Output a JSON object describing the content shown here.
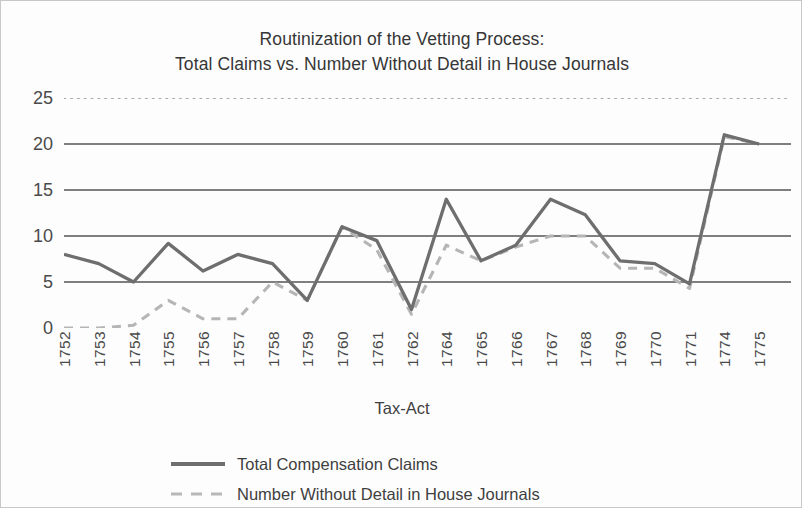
{
  "title": {
    "line1": "Routinization of the Vetting Process:",
    "line2": "Total Claims vs. Number Without Detail in House Journals"
  },
  "axes": {
    "x_title": "Tax-Act",
    "y_ticks": [
      "0",
      "5",
      "10",
      "15",
      "20",
      "25"
    ],
    "x_ticks": [
      "1752",
      "1753",
      "1754",
      "1755",
      "1756",
      "1757",
      "1758",
      "1759",
      "1760",
      "1761",
      "1762",
      "1764",
      "1765",
      "1766",
      "1767",
      "1768",
      "1769",
      "1770",
      "1771",
      "1774",
      "1775"
    ]
  },
  "legend": {
    "items": [
      {
        "label": "Total Compensation Claims",
        "color": "#6e6e6e",
        "style": "solid"
      },
      {
        "label": "Number Without Detail in House Journals",
        "color": "#b8b8b8",
        "style": "dashed"
      }
    ]
  },
  "colors": {
    "gridline": "#555555",
    "top_gridline": "#8a8a8a",
    "series_total": "#6e6e6e",
    "series_nodetail": "#b5b5b5",
    "text": "#3f3f3f",
    "background": "#fdfdfd",
    "border": "#c8c8c8"
  },
  "chart_data": {
    "type": "line",
    "title": "Routinization of the Vetting Process: Total Claims vs. Number Without Detail in House Journals",
    "xlabel": "Tax-Act",
    "ylabel": "",
    "ylim": [
      0,
      25
    ],
    "ytick_step": 5,
    "grid": true,
    "legend_position": "bottom",
    "categories": [
      "1752",
      "1753",
      "1754",
      "1755",
      "1756",
      "1757",
      "1758",
      "1759",
      "1760",
      "1761",
      "1762",
      "1764",
      "1765",
      "1766",
      "1767",
      "1768",
      "1769",
      "1770",
      "1771",
      "1774",
      "1775"
    ],
    "series": [
      {
        "name": "Total Compensation Claims",
        "color": "#6e6e6e",
        "style": "solid",
        "values": [
          8,
          7,
          5,
          9.2,
          6.2,
          8,
          7,
          3,
          11,
          9.5,
          2,
          14,
          7.3,
          9,
          14,
          12.3,
          7.3,
          7,
          4.8,
          21,
          20
        ]
      },
      {
        "name": "Number Without Detail in House Journals",
        "color": "#b5b5b5",
        "style": "dashed",
        "values": [
          0,
          0,
          0.3,
          3,
          1,
          1,
          5,
          3,
          11,
          8.5,
          1.5,
          9,
          7.3,
          8.8,
          10,
          10,
          6.5,
          6.5,
          4.3,
          20.8,
          20
        ]
      }
    ]
  }
}
